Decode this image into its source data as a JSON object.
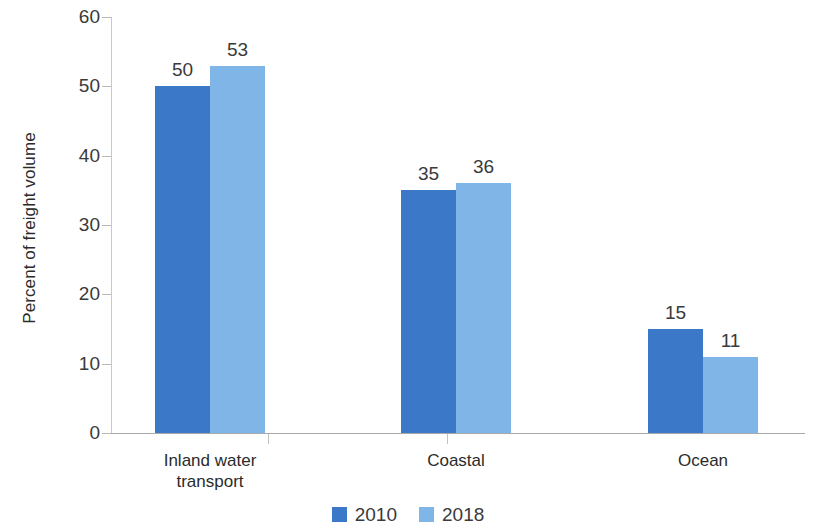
{
  "chart_data": {
    "type": "bar",
    "title": "",
    "subtitle": "",
    "xlabel": "",
    "ylabel": "Percent of freight volume",
    "categories": [
      "Inland water transport",
      "Coastal",
      "Ocean"
    ],
    "series": [
      {
        "name": "2010",
        "color": "#3B78C8",
        "values": [
          50,
          35,
          15
        ]
      },
      {
        "name": "2018",
        "color": "#80B5E8",
        "values": [
          53,
          36,
          11
        ]
      }
    ],
    "ylim": [
      0,
      60
    ],
    "yticks": [
      0,
      10,
      20,
      30,
      40,
      50,
      60
    ],
    "ytick_labels": [
      "0",
      "10",
      "20",
      "30",
      "40",
      "50",
      "60"
    ],
    "grid": false,
    "legend_position": "bottom-center",
    "data_labels": [
      {
        "series": "2010",
        "category": "Inland water transport",
        "text": "50"
      },
      {
        "series": "2018",
        "category": "Inland water transport",
        "text": "53"
      },
      {
        "series": "2010",
        "category": "Coastal",
        "text": "35"
      },
      {
        "series": "2018",
        "category": "Coastal",
        "text": "36"
      },
      {
        "series": "2010",
        "category": "Ocean",
        "text": "15"
      },
      {
        "series": "2018",
        "category": "Ocean",
        "text": "11"
      }
    ],
    "category_label_lines": [
      [
        "Inland water",
        "transport"
      ],
      [
        "Coastal"
      ],
      [
        "Ocean"
      ]
    ]
  },
  "legend": {
    "items": [
      {
        "label": "2010",
        "color": "#3B78C8"
      },
      {
        "label": "2018",
        "color": "#80B5E8"
      }
    ]
  },
  "colors": {
    "series_2010": "#3B78C8",
    "series_2018": "#80B5E8",
    "axis_line": "#a9a9a9",
    "tick_line": "#c2c2c2",
    "text": "#3a3a3a",
    "background": "#ffffff"
  }
}
